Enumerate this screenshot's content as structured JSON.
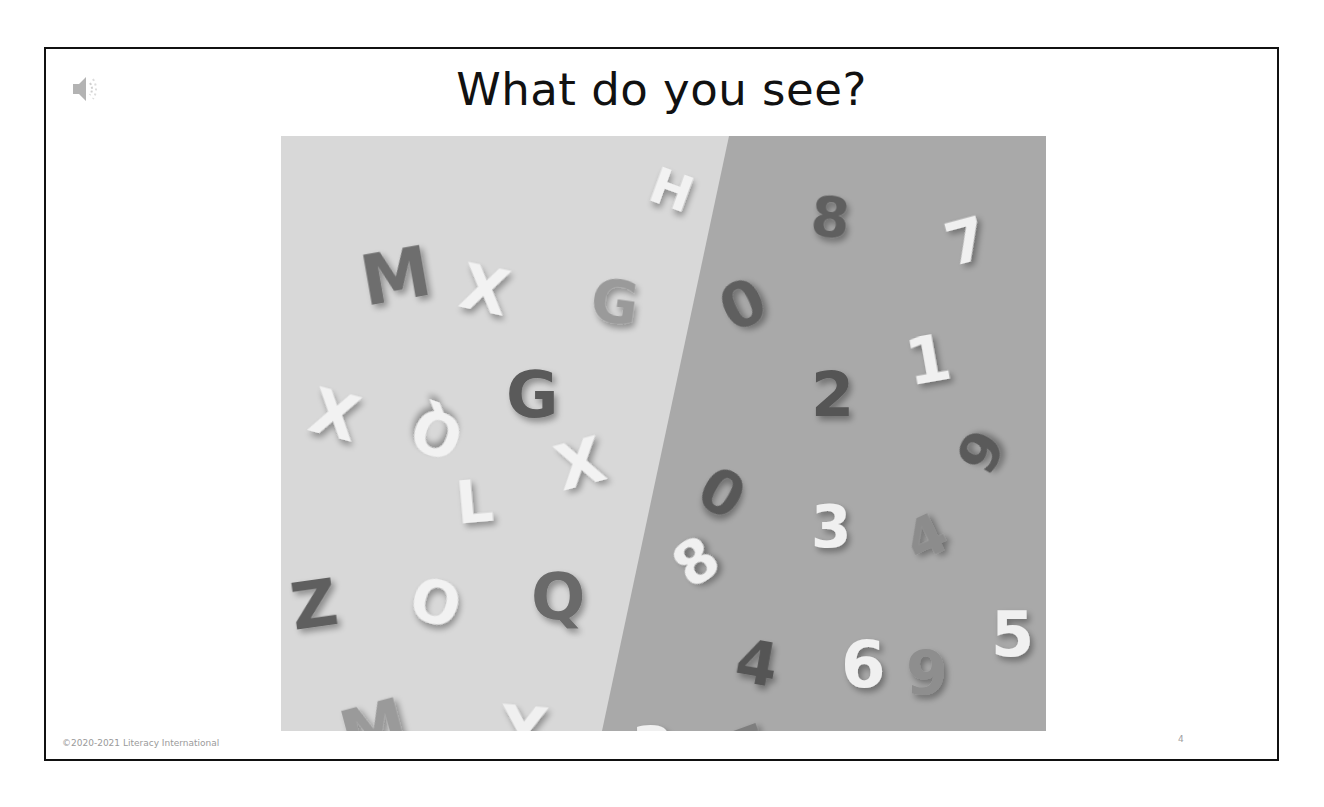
{
  "slide": {
    "title": "What do you see?",
    "footer": "©2020-2021 Literacy International",
    "page_number": "4",
    "audio_icon": "speaker-icon"
  },
  "photo": {
    "description": "Magnetic/foam letters on a light background (left) and numbers on a darker background (right), split diagonally",
    "colors": {
      "left_bg": "#d8d8d8",
      "right_bg": "#a9a9a9"
    },
    "letters": [
      {
        "char": "M",
        "x": 80,
        "y": 110,
        "size": 70,
        "rot": -10,
        "tone": "#6e6e6e"
      },
      {
        "char": "X",
        "x": 180,
        "y": 125,
        "size": 62,
        "rot": 12,
        "tone": "#f2f2f2"
      },
      {
        "char": "G",
        "x": 310,
        "y": 140,
        "size": 58,
        "rot": 8,
        "tone": "#9a9a9a"
      },
      {
        "char": "G",
        "x": 225,
        "y": 230,
        "size": 64,
        "rot": 0,
        "tone": "#5a5a5a"
      },
      {
        "char": "X",
        "x": 30,
        "y": 250,
        "size": 62,
        "rot": 15,
        "tone": "#f2f2f2"
      },
      {
        "char": "Q",
        "x": 140,
        "y": 272,
        "size": 58,
        "rot": 200,
        "tone": "#f2f2f2"
      },
      {
        "char": "X",
        "x": 275,
        "y": 300,
        "size": 62,
        "rot": -15,
        "tone": "#f2f2f2"
      },
      {
        "char": "L",
        "x": 175,
        "y": 340,
        "size": 58,
        "rot": -5,
        "tone": "#f2f2f2"
      },
      {
        "char": "Z",
        "x": 10,
        "y": 440,
        "size": 64,
        "rot": -8,
        "tone": "#5f5f5f"
      },
      {
        "char": "O",
        "x": 130,
        "y": 440,
        "size": 58,
        "rot": 15,
        "tone": "#f2f2f2"
      },
      {
        "char": "Q",
        "x": 250,
        "y": 432,
        "size": 64,
        "rot": 0,
        "tone": "#6a6a6a"
      },
      {
        "char": "M",
        "x": 60,
        "y": 565,
        "size": 66,
        "rot": -15,
        "tone": "#9a9a9a"
      },
      {
        "char": "Y",
        "x": 220,
        "y": 565,
        "size": 62,
        "rot": 5,
        "tone": "#f0f0f0"
      },
      {
        "char": "H",
        "x": 370,
        "y": 30,
        "size": 50,
        "rot": 20,
        "tone": "#f2f2f2"
      }
    ],
    "numbers": [
      {
        "char": "8",
        "x": 530,
        "y": 55,
        "size": 56,
        "rot": 5,
        "tone": "#5e5e5e"
      },
      {
        "char": "7",
        "x": 665,
        "y": 80,
        "size": 58,
        "rot": -15,
        "tone": "#f0f0f0"
      },
      {
        "char": "0",
        "x": 440,
        "y": 140,
        "size": 62,
        "rot": -25,
        "tone": "#5e5e5e"
      },
      {
        "char": "1",
        "x": 625,
        "y": 195,
        "size": 64,
        "rot": -10,
        "tone": "#f0f0f0"
      },
      {
        "char": "2",
        "x": 530,
        "y": 230,
        "size": 62,
        "rot": 0,
        "tone": "#555555"
      },
      {
        "char": "9",
        "x": 680,
        "y": 290,
        "size": 56,
        "rot": -60,
        "tone": "#5a5a5a"
      },
      {
        "char": "0",
        "x": 420,
        "y": 330,
        "size": 60,
        "rot": 30,
        "tone": "#585858"
      },
      {
        "char": "3",
        "x": 530,
        "y": 365,
        "size": 58,
        "rot": 0,
        "tone": "#f0f0f0"
      },
      {
        "char": "4",
        "x": 625,
        "y": 375,
        "size": 56,
        "rot": -25,
        "tone": "#8c8c8c"
      },
      {
        "char": "8",
        "x": 395,
        "y": 400,
        "size": 58,
        "rot": -35,
        "tone": "#f0f0f0"
      },
      {
        "char": "4",
        "x": 455,
        "y": 500,
        "size": 60,
        "rot": 10,
        "tone": "#555555"
      },
      {
        "char": "6",
        "x": 560,
        "y": 500,
        "size": 64,
        "rot": 0,
        "tone": "#f0f0f0"
      },
      {
        "char": "9",
        "x": 625,
        "y": 510,
        "size": 60,
        "rot": 0,
        "tone": "#8e8e8e"
      },
      {
        "char": "5",
        "x": 710,
        "y": 470,
        "size": 62,
        "rot": 0,
        "tone": "#f0f0f0"
      },
      {
        "char": "3",
        "x": 350,
        "y": 585,
        "size": 62,
        "rot": 0,
        "tone": "#f0f0f0"
      },
      {
        "char": "5",
        "x": 450,
        "y": 585,
        "size": 56,
        "rot": -20,
        "tone": "#7e7e7e"
      },
      {
        "char": "2",
        "x": 565,
        "y": 615,
        "size": 56,
        "rot": -10,
        "tone": "#f0f0f0"
      }
    ]
  }
}
